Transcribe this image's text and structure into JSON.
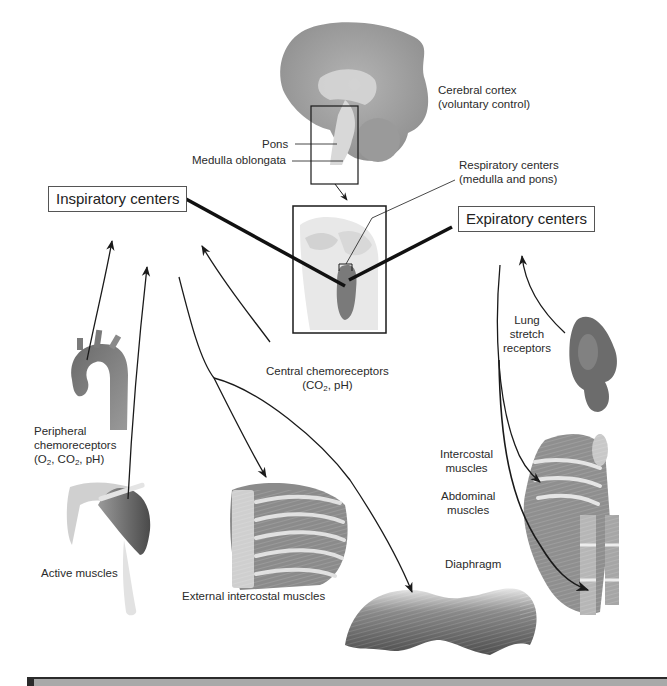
{
  "diagram": {
    "labels": {
      "cerebral_cortex": [
        "Cerebral cortex",
        "(voluntary control)"
      ],
      "pons": "Pons",
      "medulla": "Medulla oblongata",
      "respiratory_centers": [
        "Respiratory centers",
        "(medulla and pons)"
      ],
      "inspiratory_centers": "Inspiratory centers",
      "expiratory_centers": "Expiratory centers",
      "central_chemoreceptors": [
        "Central chemoreceptors",
        "(CO2, pH)"
      ],
      "peripheral_chemoreceptors": [
        "Peripheral",
        "chemoreceptors",
        "(O2, CO2, pH)"
      ],
      "lung_stretch_receptors": [
        "Lung",
        "stretch",
        "receptors"
      ],
      "intercostal_muscles": [
        "Intercostal",
        "muscles"
      ],
      "abdominal_muscles": [
        "Abdominal",
        "muscles"
      ],
      "diaphragm": "Diaphragm",
      "active_muscles": "Active muscles",
      "external_intercostal_muscles": "External intercostal muscles"
    },
    "connections": [
      {
        "from": "peripheral_chemoreceptors",
        "to": "inspiratory_centers",
        "type": "afferent"
      },
      {
        "from": "active_muscles",
        "to": "inspiratory_centers",
        "type": "afferent"
      },
      {
        "from": "central_chemoreceptors",
        "to": "inspiratory_centers",
        "type": "afferent"
      },
      {
        "from": "inspiratory_centers",
        "to": "external_intercostal_muscles",
        "type": "efferent"
      },
      {
        "from": "inspiratory_centers",
        "to": "diaphragm",
        "type": "efferent"
      },
      {
        "from": "lung_stretch_receptors",
        "to": "expiratory_centers",
        "type": "afferent"
      },
      {
        "from": "expiratory_centers",
        "to": "intercostal_muscles",
        "type": "efferent"
      },
      {
        "from": "expiratory_centers",
        "to": "abdominal_muscles",
        "type": "efferent"
      },
      {
        "from": "brain",
        "to": "respiratory_centers",
        "type": "zoom-inset"
      }
    ],
    "colors": {
      "tissue_dark": "#5e5e5e",
      "tissue_mid": "#8c8c8c",
      "tissue_light": "#c9c9c9",
      "line": "#1a1a1a",
      "footer_bar": "#a9a9a9",
      "footer_border": "#2b2b2b"
    }
  }
}
